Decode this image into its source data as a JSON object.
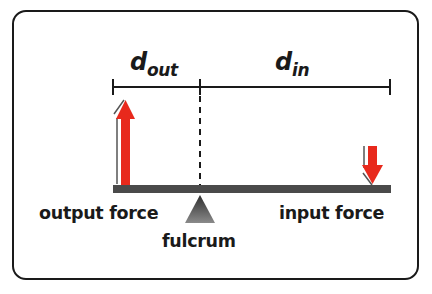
{
  "diagram": {
    "type": "lever",
    "distance_labels": {
      "out": {
        "base": "d",
        "subscript": "out"
      },
      "in": {
        "base": "d",
        "subscript": "in"
      }
    },
    "labels": {
      "output_force": "output force",
      "input_force": "input force",
      "fulcrum": "fulcrum"
    },
    "colors": {
      "arrow": "#e8291c",
      "lever": "#4a4a4a",
      "fulcrum_top": "#2e2e2e",
      "fulcrum_bottom": "#8a8a8a",
      "border": "#1a1a1a",
      "line": "#1a1a1a"
    }
  }
}
